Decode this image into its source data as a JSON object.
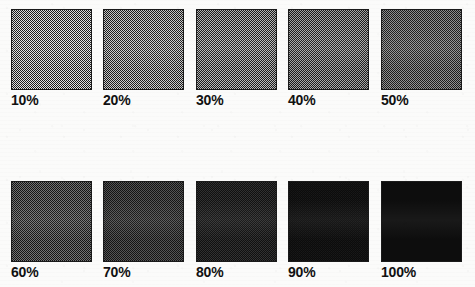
{
  "document": {
    "title": "Halftone Screen Tint Percentage Chart",
    "background_color": "#fbfbfa",
    "ink_color": "#111111",
    "border_color": "#1a1a1a"
  },
  "chart_data": {
    "type": "table",
    "subtitle": "",
    "xlabel": "",
    "ylabel": "",
    "categories": [
      "10%",
      "20%",
      "30%",
      "40%",
      "50%",
      "60%",
      "70%",
      "80%",
      "90%",
      "100%"
    ],
    "values": [
      10,
      20,
      30,
      40,
      50,
      60,
      70,
      80,
      90,
      100
    ],
    "unit": "percent",
    "legend": [],
    "grid": false,
    "rows": 2,
    "columns": 5,
    "swatches": [
      {
        "label": "10%",
        "value": 10,
        "gray_hex": "#e6e6e6",
        "dot_color": "#1c1c1c",
        "coverage": 0.1,
        "row": 1,
        "column": 1
      },
      {
        "label": "20%",
        "value": 20,
        "gray_hex": "#cfcfcf",
        "dot_color": "#1c1c1c",
        "coverage": 0.2,
        "row": 1,
        "column": 2
      },
      {
        "label": "30%",
        "value": 30,
        "gray_hex": "#bdbdbd",
        "dot_color": "#1c1c1c",
        "coverage": 0.3,
        "row": 1,
        "column": 3
      },
      {
        "label": "40%",
        "value": 40,
        "gray_hex": "#ababab",
        "dot_color": "#1c1c1c",
        "coverage": 0.4,
        "row": 1,
        "column": 4
      },
      {
        "label": "50%",
        "value": 50,
        "gray_hex": "#949494",
        "dot_color": "#1c1c1c",
        "coverage": 0.5,
        "row": 1,
        "column": 5
      },
      {
        "label": "60%",
        "value": 60,
        "gray_hex": "#7c7c7c",
        "dot_color": "#151515",
        "coverage": 0.6,
        "row": 2,
        "column": 1
      },
      {
        "label": "70%",
        "value": 70,
        "gray_hex": "#6a6a6a",
        "dot_color": "#141414",
        "coverage": 0.7,
        "row": 2,
        "column": 2
      },
      {
        "label": "80%",
        "value": 80,
        "gray_hex": "#4f4f4f",
        "dot_color": "#101010",
        "coverage": 0.8,
        "row": 2,
        "column": 3
      },
      {
        "label": "90%",
        "value": 90,
        "gray_hex": "#333333",
        "dot_color": "#0c0c0c",
        "coverage": 0.9,
        "row": 2,
        "column": 4
      },
      {
        "label": "100%",
        "value": 100,
        "gray_hex": "#0d0d0d",
        "dot_color": "#0d0d0d",
        "coverage": 1.0,
        "row": 2,
        "column": 5
      }
    ]
  }
}
